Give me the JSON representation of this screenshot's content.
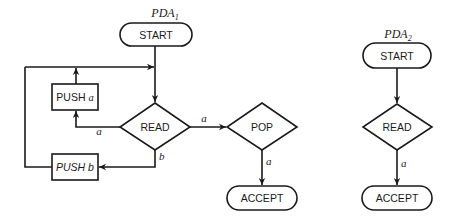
{
  "pda1": {
    "title_main": "PDA",
    "title_sub": "1",
    "nodes": {
      "start": "START",
      "push_a_prefix": "PUSH ",
      "push_a_symbol": "a",
      "push_b": "PUSH b",
      "read": "READ",
      "pop": "POP",
      "accept": "ACCEPT"
    },
    "edges": {
      "read_to_push_a": "a",
      "read_to_push_b": "b",
      "read_to_pop": "a",
      "pop_to_accept": "a"
    }
  },
  "pda2": {
    "title_main": "PDA",
    "title_sub": "2",
    "nodes": {
      "start": "START",
      "read": "READ",
      "accept": "ACCEPT"
    },
    "edges": {
      "read_to_accept": "a"
    }
  },
  "colors": {
    "stroke": "#1a1a1a",
    "background": "#ffffff"
  }
}
